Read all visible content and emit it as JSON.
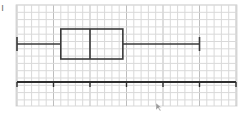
{
  "chart_data": {
    "type": "boxplot",
    "title": "",
    "xlabel": "",
    "ylabel": "",
    "grid": true,
    "legend": null,
    "number_line": {
      "tick_count": 7,
      "tick_values": [
        0,
        1,
        2,
        3,
        4,
        5,
        6
      ],
      "tick_labels": [
        "",
        "",
        "",
        "",
        "",
        "",
        ""
      ],
      "minor_divisions_per_tick": 5,
      "xlim": [
        0,
        6
      ]
    },
    "boxplot": {
      "min": 0,
      "q1": 1.2,
      "median": 2.0,
      "q3": 2.9,
      "max": 5.0
    }
  },
  "colors": {
    "background": "#ffffff",
    "grid_line": "#d9d9d9",
    "grid_major": "#bdbdbd",
    "plot_stroke": "#3a3a3a",
    "axis_stroke": "#2e2e2e"
  },
  "layout": {
    "grid": {
      "x0": 16,
      "y0": 5,
      "x1": 237,
      "y1": 106,
      "cell": 7.3
    },
    "origin_x": 17,
    "unit_px": 36.5,
    "box": {
      "y_top": 29,
      "y_bottom": 59,
      "whisker_y": 44,
      "cap_half": 7
    },
    "axis_y": 82,
    "tick_height": 5
  },
  "decorations": {
    "corner_mark": "ı",
    "cursor": "pointer-cursor"
  }
}
